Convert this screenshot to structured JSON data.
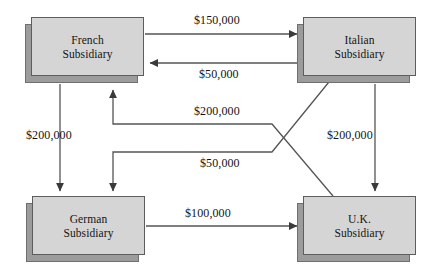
{
  "diagram": {
    "type": "flow-diagram",
    "stroke_color": "#555555",
    "box_fill_color": "#d5d5d5",
    "box_shadow_color": "#9c9c9c",
    "background_color": "#ffffff"
  },
  "nodes": {
    "french": {
      "line1": "French",
      "line2": "Subsidiary"
    },
    "italian": {
      "line1": "Italian",
      "line2": "Subsidiary"
    },
    "german": {
      "line1": "German",
      "line2": "Subsidiary"
    },
    "uk": {
      "line1": "U.K.",
      "line2": "Subsidiary"
    }
  },
  "flows": [
    {
      "id": "french-to-italian",
      "label": "$150,000",
      "from": "French Subsidiary",
      "to": "Italian Subsidiary"
    },
    {
      "id": "italian-to-french",
      "label": "$50,000",
      "from": "Italian Subsidiary",
      "to": "French Subsidiary"
    },
    {
      "id": "uk-to-french",
      "label": "$200,000",
      "from": "U.K. Subsidiary",
      "to": "French Subsidiary"
    },
    {
      "id": "italian-to-german",
      "label": "$50,000",
      "from": "Italian Subsidiary",
      "to": "German Subsidiary"
    },
    {
      "id": "french-to-german",
      "label": "$200,000",
      "from": "French Subsidiary",
      "to": "German Subsidiary"
    },
    {
      "id": "italian-to-uk",
      "label": "$200,000",
      "from": "Italian Subsidiary",
      "to": "U.K. Subsidiary"
    },
    {
      "id": "german-to-uk",
      "label": "$100,000",
      "from": "German Subsidiary",
      "to": "U.K. Subsidiary"
    }
  ]
}
